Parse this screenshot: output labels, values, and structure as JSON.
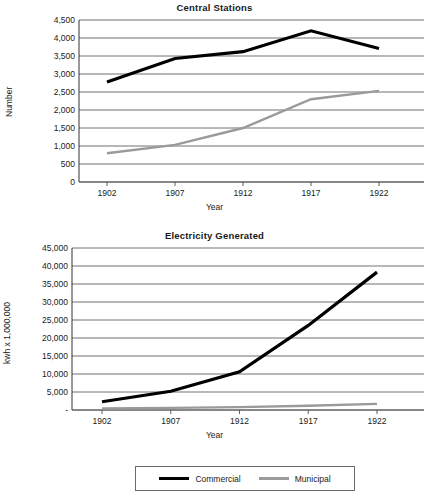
{
  "charts": [
    {
      "id": "central-stations",
      "title": "Central Stations",
      "ylabel": "Number",
      "xlabel": "Year"
    },
    {
      "id": "electricity-generated",
      "title": "Electricity Generated",
      "ylabel": "kwh x 1,000,000",
      "xlabel": "Year"
    }
  ],
  "legend": {
    "items": [
      {
        "label": "Commercial",
        "color": "#000000"
      },
      {
        "label": "Municipal",
        "color": "#9a9a9a"
      }
    ]
  },
  "chart_data": [
    {
      "type": "line",
      "title": "Central Stations",
      "xlabel": "Year",
      "ylabel": "Number",
      "categories": [
        1902,
        1907,
        1912,
        1917,
        1922
      ],
      "xtick_labels": [
        "1902",
        "1907",
        "1912",
        "1917",
        "1922"
      ],
      "ytick_labels": [
        "0",
        "500",
        "1,000",
        "1,500",
        "2,000",
        "2,500",
        "3,000",
        "3,500",
        "4,000",
        "4,500"
      ],
      "ytick_values": [
        0,
        500,
        1000,
        1500,
        2000,
        2500,
        3000,
        3500,
        4000,
        4500
      ],
      "ylim": [
        0,
        4500
      ],
      "grid": true,
      "legend_position": "below-figure-shared",
      "series": [
        {
          "name": "Commercial",
          "color": "#000000",
          "values": [
            2780,
            3430,
            3620,
            4200,
            3710
          ]
        },
        {
          "name": "Municipal",
          "color": "#9a9a9a",
          "values": [
            800,
            1030,
            1500,
            2300,
            2530
          ]
        }
      ]
    },
    {
      "type": "line",
      "title": "Electricity Generated",
      "xlabel": "Year",
      "ylabel": "kwh x 1,000,000",
      "categories": [
        1902,
        1907,
        1912,
        1917,
        1922
      ],
      "xtick_labels": [
        "1902",
        "1907",
        "1912",
        "1917",
        "1922"
      ],
      "ytick_labels": [
        "-",
        "5,000",
        "10,000",
        "15,000",
        "20,000",
        "25,000",
        "30,000",
        "35,000",
        "40,000",
        "45,000"
      ],
      "ytick_values": [
        0,
        5000,
        10000,
        15000,
        20000,
        25000,
        30000,
        35000,
        40000,
        45000
      ],
      "ylim": [
        0,
        45000
      ],
      "grid": true,
      "legend_position": "below-figure-shared",
      "series": [
        {
          "name": "Commercial",
          "color": "#000000",
          "values": [
            2300,
            5200,
            10600,
            23500,
            38300
          ]
        },
        {
          "name": "Municipal",
          "color": "#9a9a9a",
          "values": [
            400,
            600,
            800,
            1200,
            1700
          ]
        }
      ]
    }
  ]
}
